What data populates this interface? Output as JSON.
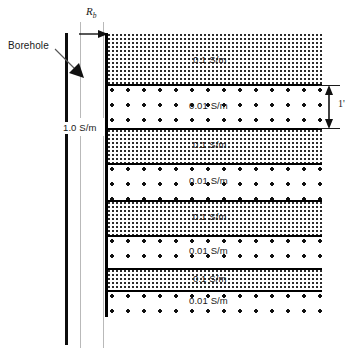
{
  "figure": {
    "type": "borehole-formation-cross-section",
    "title": ""
  },
  "annotations": {
    "borehole_label": "Borehole",
    "borehole_fluid_conductivity": "1.0 S/m",
    "borehole_radius_symbol": "R",
    "borehole_radius_subscript": "b",
    "bed_thickness_label": "1'"
  },
  "layers": [
    {
      "index": 0,
      "label": "0.1 S/m",
      "fill": "fine-stipple",
      "value": 0.1,
      "unit": "S/m"
    },
    {
      "index": 1,
      "label": "0.01 S/m",
      "fill": "sparse-dots",
      "value": 0.01,
      "unit": "S/m"
    },
    {
      "index": 2,
      "label": "0.1 S/m",
      "fill": "fine-stipple",
      "value": 0.1,
      "unit": "S/m"
    },
    {
      "index": 3,
      "label": "0.01 S/m",
      "fill": "sparse-dots",
      "value": 0.01,
      "unit": "S/m"
    },
    {
      "index": 4,
      "label": "0.1 S/m",
      "fill": "fine-stipple",
      "value": 0.1,
      "unit": "S/m"
    },
    {
      "index": 5,
      "label": "0.01 S/m",
      "fill": "sparse-dots",
      "value": 0.01,
      "unit": "S/m"
    },
    {
      "index": 6,
      "label": "0.1 S/m",
      "fill": "fine-stipple",
      "value": 0.1,
      "unit": "S/m"
    },
    {
      "index": 7,
      "label": "0.01 S/m",
      "fill": "sparse-dots",
      "value": 0.01,
      "unit": "S/m"
    }
  ],
  "colors": {
    "line": "#000000",
    "dot": "#111111",
    "witness": "#b9b9b9",
    "background": "#ffffff",
    "text": "#1a1a1a"
  }
}
